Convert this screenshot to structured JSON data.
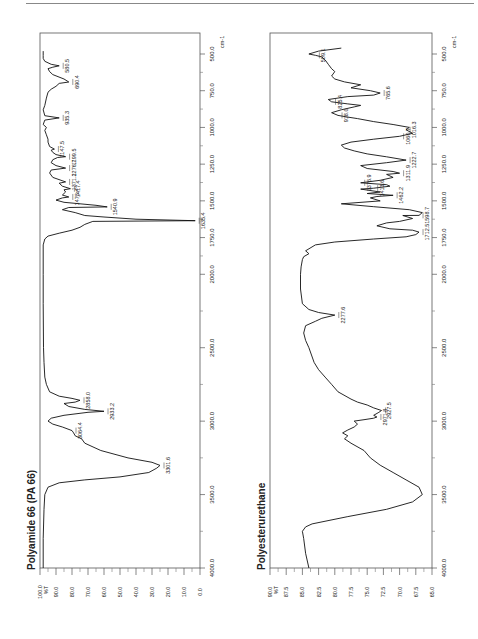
{
  "page": {
    "orientation": "rotated-90-ccw",
    "top_rule": true
  },
  "chart_data": [
    {
      "type": "line",
      "title": "Polyamide 66 (PA 66)",
      "xlabel": "cm-1",
      "ylabel": "%T",
      "x_range": [
        4000.0,
        500.0
      ],
      "ylim": [
        0.0,
        100.0
      ],
      "x_ticks": [
        "4000.0",
        "3500.0",
        "3000.0",
        "2500.0",
        "2000.0",
        "1750.0",
        "1500.0",
        "1250.0",
        "1000.0",
        "750.0",
        "500.0"
      ],
      "y_ticks": [
        "100.0",
        "90.0",
        "80.0",
        "70.0",
        "60.0",
        "50.0",
        "40.0",
        "30.0",
        "20.0",
        "10.0",
        "0.0"
      ],
      "grid": false,
      "peak_labels": [
        "3301.6",
        "3064.4",
        "2933.2",
        "2858.0",
        "1635.4",
        "1540.9",
        "1473.4",
        "1417.4",
        "1371.2",
        "1276.7",
        "1199.5",
        "1147.5",
        "935.3",
        "690.4",
        "580.5"
      ],
      "x": [
        4000,
        3800,
        3600,
        3500,
        3450,
        3420,
        3400,
        3380,
        3350,
        3320,
        3301.6,
        3280,
        3250,
        3200,
        3150,
        3120,
        3100,
        3080,
        3064.4,
        3040,
        3020,
        3000,
        2980,
        2960,
        2940,
        2933.2,
        2920,
        2900,
        2880,
        2870,
        2858,
        2845,
        2830,
        2800,
        2750,
        2700,
        2600,
        2500,
        2200,
        2000,
        1800,
        1760,
        1740,
        1720,
        1700,
        1680,
        1660,
        1640,
        1635.4,
        1625,
        1610,
        1600,
        1580,
        1560,
        1545,
        1540.9,
        1530,
        1510,
        1495,
        1480,
        1473.4,
        1460,
        1440,
        1425,
        1417.4,
        1400,
        1380,
        1371.2,
        1340,
        1310,
        1290,
        1276.7,
        1260,
        1240,
        1220,
        1205,
        1199.5,
        1185,
        1170,
        1155,
        1147.5,
        1130,
        1100,
        1080,
        1050,
        1020,
        1000,
        980,
        950,
        935.3,
        920,
        880,
        850,
        800,
        760,
        740,
        720,
        700,
        690.4,
        670,
        640,
        620,
        600,
        590,
        580.5,
        570,
        550,
        530,
        510,
        500,
        480
      ],
      "values": [
        98,
        98,
        97.5,
        97,
        95,
        88,
        72,
        50,
        32,
        27,
        25,
        30,
        45,
        62,
        72,
        74,
        78,
        79,
        80,
        86,
        92,
        95,
        93,
        85,
        70,
        60,
        72,
        82,
        85,
        78,
        75,
        80,
        88,
        94,
        96,
        97,
        97.5,
        97.8,
        98,
        98,
        98,
        97,
        95,
        88,
        80,
        75,
        72,
        67,
        3,
        40,
        60,
        72,
        78,
        86,
        82,
        58,
        65,
        85,
        90,
        86,
        82,
        86,
        84,
        85,
        81,
        86,
        88,
        84,
        92,
        94,
        93,
        84,
        90,
        93,
        92,
        89,
        84,
        90,
        92,
        93,
        91,
        94,
        95,
        95,
        96,
        97,
        96,
        98,
        97,
        88,
        97,
        98,
        97,
        96,
        95,
        93,
        90,
        88,
        82,
        85,
        92,
        94,
        95,
        92,
        88,
        93,
        97,
        98,
        98,
        98,
        98
      ]
    },
    {
      "type": "line",
      "title": "Polyesterurethane",
      "xlabel": "cm-1",
      "ylabel": "%T",
      "x_range": [
        4000.0,
        500.0
      ],
      "ylim": [
        65.0,
        90.0
      ],
      "x_ticks": [
        "4000.0",
        "3500.0",
        "3000.0",
        "2500.0",
        "2000.0",
        "1750.0",
        "1500.0",
        "1250.0",
        "1000.0",
        "750.0",
        "500.0"
      ],
      "y_ticks": [
        "90.0",
        "87.5",
        "85.0",
        "82.5",
        "80.0",
        "77.5",
        "75.0",
        "72.5",
        "70.0",
        "67.5",
        "65.0"
      ],
      "grid": false,
      "peak_labels": [
        "2971.8",
        "2927.5",
        "2277.6",
        "1712.5",
        "1598.7",
        "1462.2",
        "1413.6",
        "1376.9",
        "1311.9",
        "1222.7",
        "1060.7",
        "1016.3",
        "918.0",
        "825.4",
        "765.6",
        "509.1"
      ],
      "x": [
        4000,
        3900,
        3800,
        3750,
        3720,
        3700,
        3650,
        3600,
        3550,
        3500,
        3450,
        3400,
        3350,
        3300,
        3250,
        3200,
        3150,
        3120,
        3100,
        3080,
        3060,
        3040,
        3020,
        3000,
        2990,
        2980,
        2971.8,
        2960,
        2940,
        2927.5,
        2910,
        2890,
        2870,
        2850,
        2800,
        2750,
        2700,
        2650,
        2600,
        2500,
        2450,
        2400,
        2350,
        2320,
        2300,
        2277.6,
        2260,
        2240,
        2200,
        2100,
        2000,
        1950,
        1900,
        1880,
        1860,
        1840,
        1800,
        1780,
        1760,
        1745,
        1730,
        1712.5,
        1700,
        1690,
        1670,
        1650,
        1640,
        1620,
        1600,
        1598.7,
        1580,
        1560,
        1540,
        1520,
        1500,
        1480,
        1470,
        1462.2,
        1450,
        1440,
        1420,
        1413.6,
        1400,
        1390,
        1376.9,
        1360,
        1340,
        1320,
        1311.9,
        1300,
        1280,
        1260,
        1240,
        1222.7,
        1200,
        1180,
        1160,
        1140,
        1120,
        1100,
        1080,
        1060.7,
        1040,
        1016.3,
        1000,
        980,
        960,
        940,
        930,
        918,
        900,
        880,
        860,
        850,
        840,
        825.4,
        810,
        790,
        780,
        765.6,
        750,
        730,
        710,
        690,
        670,
        650,
        620,
        600,
        570,
        540,
        520,
        509.1,
        500,
        480,
        460
      ],
      "values": [
        84,
        84.5,
        84.8,
        85,
        84.5,
        83.5,
        78,
        72,
        68,
        66.5,
        67,
        69,
        71,
        73,
        74.5,
        75.5,
        77.5,
        78.5,
        78,
        78.8,
        78,
        77,
        76.5,
        77,
        75.5,
        74,
        73.5,
        74,
        73.2,
        72.8,
        74,
        75,
        76.5,
        77.5,
        79.5,
        80.5,
        81.5,
        82.5,
        83.2,
        84,
        84.5,
        84.8,
        84.5,
        83,
        82,
        80,
        82.5,
        84,
        85,
        85.3,
        85.3,
        85.2,
        85,
        84.8,
        84,
        84.5,
        83,
        80,
        74,
        69,
        67.5,
        67,
        68,
        71.5,
        73.5,
        72,
        70,
        68,
        69.5,
        67,
        66.5,
        68.5,
        74,
        79,
        73,
        74.5,
        73.5,
        71,
        75,
        73,
        76,
        74,
        71.5,
        72,
        76,
        73,
        71,
        72,
        70,
        71,
        75,
        76,
        72,
        69,
        72,
        75,
        77,
        78.5,
        79,
        77.5,
        74,
        70,
        68,
        69,
        68.5,
        71,
        74,
        76.5,
        78,
        79.5,
        80.5,
        79,
        77,
        76,
        78,
        80.5,
        81,
        78,
        74,
        73,
        74.5,
        77.5,
        76,
        78.5,
        80,
        80.5,
        80,
        80.5,
        81,
        81.5,
        82,
        83,
        84,
        82.5,
        79,
        77.5,
        79,
        83,
        85.5,
        87
      ]
    }
  ]
}
